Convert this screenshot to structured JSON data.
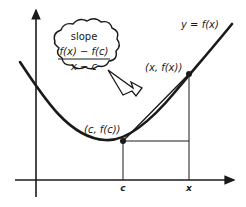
{
  "diagram": {
    "curve_label": "y = f(x)",
    "point_c_label": "(c, f(c))",
    "point_x_label": "(x, f(x))",
    "axis_tick_c": "c",
    "axis_tick_x": "x",
    "callout": {
      "heading": "slope",
      "numerator": "f(x) − f(c)",
      "denominator": "x − c"
    },
    "colors": {
      "ink": "#1a1a1a",
      "background": "#ffffff"
    }
  }
}
